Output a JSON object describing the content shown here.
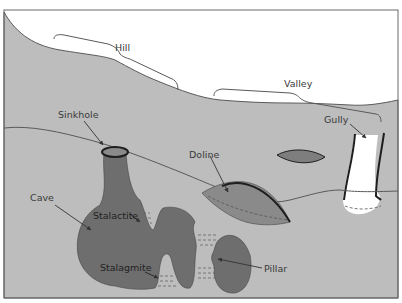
{
  "diagram": {
    "colors": {
      "background": "#ffffff",
      "ground": "#bdbdbd",
      "cave_fill": "#6e6e6e",
      "doline_fill": "#8a8a8a",
      "outline": "#5a5a5a",
      "rim": "#1e1e1e",
      "label": "#3a3a3a",
      "arrow": "#333333"
    },
    "labels": {
      "hill": "Hill",
      "valley": "Valley",
      "sinkhole": "Sinkhole",
      "doline": "Doline",
      "gully": "Gully",
      "cave": "Cave",
      "stalactite": "Stalactite",
      "stalagmite": "Stalagmite",
      "pillar": "Pillar"
    }
  }
}
